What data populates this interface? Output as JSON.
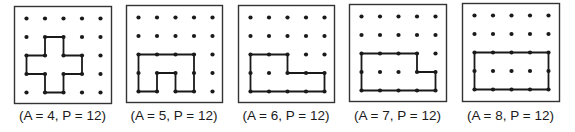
{
  "figure": {
    "grid": {
      "cols": 5,
      "rows": 5,
      "spacing": 18.5,
      "dot_radius": 2.1
    },
    "colors": {
      "ink": "#1a1a1a",
      "frame": "#333333",
      "background": "#ffffff"
    },
    "panels": [
      {
        "id": 1,
        "caption": "(A = 4, P = 12)",
        "area": 4,
        "perimeter": 12,
        "box": {
          "x": 14,
          "y": 6,
          "w": 97,
          "h": 97
        },
        "polygon": [
          [
            1,
            1
          ],
          [
            2,
            1
          ],
          [
            2,
            2
          ],
          [
            3,
            2
          ],
          [
            3,
            3
          ],
          [
            2,
            3
          ],
          [
            2,
            4
          ],
          [
            1,
            4
          ],
          [
            1,
            3
          ],
          [
            0,
            3
          ],
          [
            0,
            2
          ],
          [
            1,
            2
          ]
        ]
      },
      {
        "id": 2,
        "caption": "(A = 5, P = 12)",
        "area": 5,
        "perimeter": 12,
        "box": {
          "x": 126,
          "y": 5,
          "w": 96,
          "h": 97
        },
        "polygon": [
          [
            0,
            2
          ],
          [
            3,
            2
          ],
          [
            3,
            4
          ],
          [
            2,
            4
          ],
          [
            2,
            3
          ],
          [
            1,
            3
          ],
          [
            1,
            4
          ],
          [
            0,
            4
          ]
        ]
      },
      {
        "id": 3,
        "caption": "(A = 6, P = 12)",
        "area": 6,
        "perimeter": 12,
        "box": {
          "x": 238,
          "y": 5,
          "w": 96,
          "h": 97
        },
        "polygon": [
          [
            0,
            2
          ],
          [
            2,
            2
          ],
          [
            2,
            3
          ],
          [
            4,
            3
          ],
          [
            4,
            4
          ],
          [
            0,
            4
          ]
        ]
      },
      {
        "id": 4,
        "caption": "(A = 7, P = 12)",
        "area": 7,
        "perimeter": 12,
        "box": {
          "x": 349,
          "y": 4,
          "w": 97,
          "h": 97
        },
        "polygon": [
          [
            0,
            2
          ],
          [
            3,
            2
          ],
          [
            3,
            3
          ],
          [
            4,
            3
          ],
          [
            4,
            4
          ],
          [
            0,
            4
          ]
        ]
      },
      {
        "id": 5,
        "caption": "(A = 8, P = 12)",
        "area": 8,
        "perimeter": 12,
        "box": {
          "x": 462,
          "y": 3,
          "w": 97,
          "h": 98
        },
        "polygon": [
          [
            0,
            2
          ],
          [
            4,
            2
          ],
          [
            4,
            4
          ],
          [
            0,
            4
          ]
        ]
      }
    ]
  }
}
